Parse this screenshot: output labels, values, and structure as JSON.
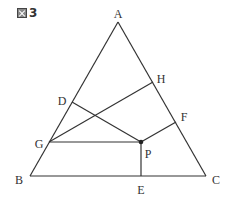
{
  "figure": {
    "title_number": "3",
    "title_icon": "figure-kanji-icon"
  },
  "points": {
    "A": {
      "label": "A",
      "x": 118,
      "y": 22,
      "lx": 118,
      "ly": 15
    },
    "B": {
      "label": "B",
      "x": 30,
      "y": 176,
      "lx": 19,
      "ly": 181
    },
    "C": {
      "label": "C",
      "x": 206,
      "y": 176,
      "lx": 216,
      "ly": 181
    },
    "D": {
      "label": "D",
      "x": 72,
      "y": 102,
      "lx": 62,
      "ly": 102
    },
    "E": {
      "label": "E",
      "x": 141,
      "y": 176,
      "lx": 141,
      "ly": 191
    },
    "F": {
      "label": "F",
      "x": 176,
      "y": 122,
      "lx": 184,
      "ly": 118
    },
    "G": {
      "label": "G",
      "x": 49,
      "y": 142,
      "lx": 39,
      "ly": 145
    },
    "H": {
      "label": "H",
      "x": 153,
      "y": 82,
      "lx": 161,
      "ly": 80
    },
    "P": {
      "label": "P",
      "x": 141,
      "y": 142,
      "lx": 148,
      "ly": 155
    }
  },
  "segments": [
    [
      "A",
      "B"
    ],
    [
      "B",
      "C"
    ],
    [
      "C",
      "A"
    ],
    [
      "D",
      "P"
    ],
    [
      "G",
      "H"
    ],
    [
      "G",
      "P"
    ],
    [
      "P",
      "F"
    ],
    [
      "P",
      "E"
    ]
  ],
  "colors": {
    "stroke": "#333333",
    "background": "#ffffff"
  }
}
